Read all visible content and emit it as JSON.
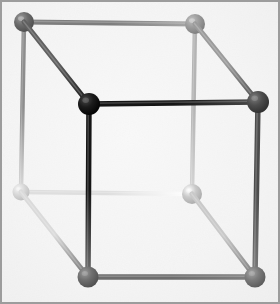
{
  "figure": {
    "title": "Ball-and-stick cube",
    "type": "3d-wireframe-cube",
    "width": 280,
    "height": 304,
    "background_color": "#eaeaea",
    "border_color": "#9c9c9c",
    "border_width": 2,
    "inner_highlight_color": "#f2f2f2",
    "shading_model": "depth-cued-grayscale",
    "vertex_radius": 9.5,
    "edge_width": 5.5
  },
  "vertices": [
    {
      "id": "back-top-left",
      "name": "vertex-back-top-left",
      "x": 24,
      "y": 22,
      "r": 10,
      "color": "#6c6c6c",
      "highlight": "#9a9a9a",
      "shadow": "#4a4a4a",
      "depth": "back"
    },
    {
      "id": "back-top-right",
      "name": "vertex-back-top-right",
      "x": 195,
      "y": 24,
      "r": 10,
      "color": "#9d9d9d",
      "highlight": "#c0c0c0",
      "shadow": "#7a7a7a",
      "depth": "back"
    },
    {
      "id": "back-bottom-left",
      "name": "vertex-back-bottom-left",
      "x": 21,
      "y": 192,
      "r": 8.5,
      "color": "#d9d9d9",
      "highlight": "#f4f4f4",
      "shadow": "#bcbcbc",
      "depth": "back"
    },
    {
      "id": "back-bottom-right",
      "name": "vertex-back-bottom-right",
      "x": 192,
      "y": 194,
      "r": 10,
      "color": "#cacaca",
      "highlight": "#ffffff",
      "shadow": "#a8a8a8",
      "depth": "back"
    },
    {
      "id": "front-top-left",
      "name": "vertex-front-top-left",
      "x": 89,
      "y": 104,
      "r": 11,
      "color": "#1b1b1b",
      "highlight": "#484848",
      "shadow": "#000000",
      "depth": "front"
    },
    {
      "id": "front-top-right",
      "name": "vertex-front-top-right",
      "x": 258,
      "y": 102,
      "r": 11,
      "color": "#4e4e4e",
      "highlight": "#7c7c7c",
      "shadow": "#2c2c2c",
      "depth": "front"
    },
    {
      "id": "front-bottom-left",
      "name": "vertex-front-bottom-left",
      "x": 88,
      "y": 277,
      "r": 10.5,
      "color": "#6f6f6f",
      "highlight": "#9a9a9a",
      "shadow": "#4d4d4d",
      "depth": "front"
    },
    {
      "id": "front-bottom-right",
      "name": "vertex-front-bottom-right",
      "x": 255,
      "y": 277,
      "r": 10.5,
      "color": "#7b7b7b",
      "highlight": "#a4a4a4",
      "shadow": "#585858",
      "depth": "front"
    }
  ],
  "edges": [
    {
      "id": "back-top",
      "name": "edge-back-top",
      "from": "back-top-left",
      "to": "back-top-right",
      "width": 5,
      "color_start": "#7d7d7d",
      "color_end": "#a8a8a8"
    },
    {
      "id": "back-left-vertical",
      "name": "edge-back-left-vertical",
      "from": "back-top-left",
      "to": "back-bottom-left",
      "width": 4.5,
      "color_start": "#8d8d8d",
      "color_end": "#dcdcdc"
    },
    {
      "id": "back-right-vertical",
      "name": "edge-back-right-vertical",
      "from": "back-top-right",
      "to": "back-bottom-right",
      "width": 4.5,
      "color_start": "#b4b4b4",
      "color_end": "#d6d6d6"
    },
    {
      "id": "back-bottom",
      "name": "edge-back-bottom",
      "from": "back-bottom-left",
      "to": "back-bottom-right",
      "width": 4.5,
      "color_start": "#dedede",
      "color_end": "#ffffff"
    },
    {
      "id": "front-top",
      "name": "edge-front-top",
      "from": "front-top-left",
      "to": "front-top-right",
      "width": 5.5,
      "color_start": "#151515",
      "color_end": "#4a4a4a"
    },
    {
      "id": "front-left-vertical",
      "name": "edge-front-left-vertical",
      "from": "front-top-left",
      "to": "front-bottom-left",
      "width": 5.5,
      "color_start": "#151515",
      "color_end": "#6e6e6e"
    },
    {
      "id": "front-right-vertical",
      "name": "edge-front-right-vertical",
      "from": "front-top-right",
      "to": "front-bottom-right",
      "width": 5.5,
      "color_start": "#4c4c4c",
      "color_end": "#7a7a7a"
    },
    {
      "id": "front-bottom",
      "name": "edge-front-bottom",
      "from": "front-bottom-left",
      "to": "front-bottom-right",
      "width": 5.5,
      "color_start": "#6d6d6d",
      "color_end": "#808080"
    },
    {
      "id": "diag-top-left",
      "name": "edge-diagonal-top-left",
      "from": "back-top-left",
      "to": "front-top-left",
      "width": 5,
      "color_start": "#606060",
      "color_end": "#1a1a1a"
    },
    {
      "id": "diag-top-right",
      "name": "edge-diagonal-top-right",
      "from": "back-top-right",
      "to": "front-top-right",
      "width": 5,
      "color_start": "#9b9b9b",
      "color_end": "#4e4e4e"
    },
    {
      "id": "diag-bottom-left",
      "name": "edge-diagonal-bottom-left",
      "from": "back-bottom-left",
      "to": "front-bottom-left",
      "width": 5,
      "color_start": "#dadada",
      "color_end": "#707070"
    },
    {
      "id": "diag-bottom-right",
      "name": "edge-diagonal-bottom-right",
      "from": "back-bottom-right",
      "to": "front-bottom-right",
      "width": 5,
      "color_start": "#c9c9c9",
      "color_end": "#7c7c7c"
    }
  ],
  "draw_order": {
    "edges_back": [
      "back-top",
      "back-left-vertical",
      "back-right-vertical",
      "back-bottom"
    ],
    "vertices_back": [
      "back-bottom-left",
      "back-bottom-right",
      "back-top-right",
      "back-top-left"
    ],
    "edges_diagonal": [
      "diag-bottom-left",
      "diag-bottom-right",
      "diag-top-right",
      "diag-top-left"
    ],
    "edges_front": [
      "front-bottom",
      "front-right-vertical",
      "front-left-vertical",
      "front-top"
    ],
    "vertices_front": [
      "front-bottom-right",
      "front-bottom-left",
      "front-top-right",
      "front-top-left"
    ]
  }
}
